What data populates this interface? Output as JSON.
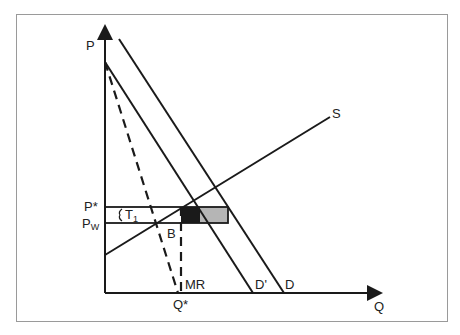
{
  "diagram": {
    "type": "economics-supply-demand",
    "axes": {
      "y_label": "P",
      "x_label": "Q"
    },
    "curves": {
      "supply": "S",
      "demand": "D",
      "demand_shifted": "D'",
      "marginal_revenue": "MR"
    },
    "price_labels": {
      "p_star": "P*",
      "p_world_main": "P",
      "p_world_sub": "W"
    },
    "quantity_labels": {
      "q_star": "Q*"
    },
    "annotations": {
      "tariff_main": "T",
      "tariff_sub": "1",
      "point_b": "B"
    },
    "colors": {
      "line": "#1a1a1a",
      "dark_box": "#1a1a1a",
      "gray_box": "#b5b5b5",
      "frame": "#9a9a9a"
    }
  }
}
